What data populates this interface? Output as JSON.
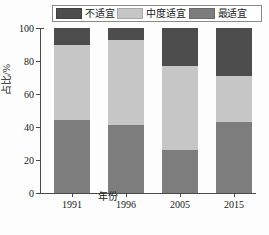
{
  "legend": {
    "entries": [
      {
        "label": "不适宜",
        "color": "#4d4d4d",
        "key": "unsuitable"
      },
      {
        "label": "中度适宜",
        "color": "#c6c6c6",
        "key": "moderate"
      },
      {
        "label": "最适宜",
        "color": "#7d7d7d",
        "key": "most"
      }
    ]
  },
  "axes": {
    "ylabel": "占比/%",
    "xlabel": "年份",
    "yticks": [
      "0",
      "20",
      "40",
      "60",
      "80",
      "100"
    ],
    "xticks": [
      "1991",
      "1996",
      "2005",
      "2015"
    ]
  },
  "chart_data": {
    "type": "bar",
    "stacked": true,
    "normalized": true,
    "title": "",
    "subtitle": "",
    "xlabel": "年份",
    "ylabel": "占比/%",
    "ylim": [
      0,
      100
    ],
    "ytick_values": [
      0,
      20,
      40,
      60,
      80,
      100
    ],
    "grid": false,
    "legend_position": "top",
    "categories": [
      "1991",
      "1996",
      "2005",
      "2015"
    ],
    "series": [
      {
        "name": "最适宜",
        "color": "#7d7d7d",
        "values": [
          44,
          41,
          26,
          43
        ]
      },
      {
        "name": "中度适宜",
        "color": "#c6c6c6",
        "values": [
          46,
          52,
          51,
          28
        ]
      },
      {
        "name": "不适宜",
        "color": "#4d4d4d",
        "values": [
          10,
          7,
          23,
          29
        ]
      }
    ]
  }
}
